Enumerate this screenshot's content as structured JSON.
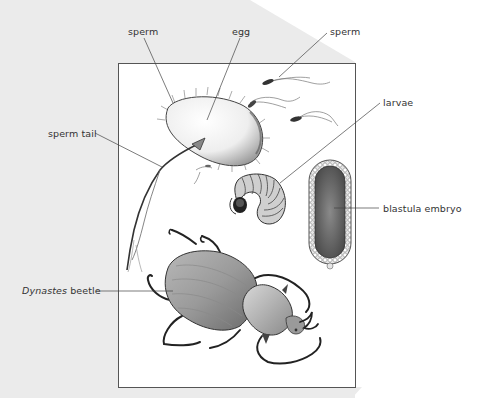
{
  "figure": {
    "type": "labeled biology illustration",
    "colors": {
      "background_panel": "#ebebeb",
      "page": "#ffffff",
      "frame_border": "#555555",
      "leader_line": "#444444",
      "label_text": "#333333"
    }
  },
  "labels": {
    "sperm_left": "sperm",
    "egg": "egg",
    "sperm_right": "sperm",
    "sperm_tail": "sperm tail",
    "larvae": "larvae",
    "blastula_embryo": "blastula embryo",
    "beetle_genus": "Dynastes",
    "beetle_word": "beetle"
  },
  "illustrations": [
    {
      "name": "egg",
      "description": "elongated oval egg with fine surface hairs"
    },
    {
      "name": "sperm",
      "description": "several sperm cells with long wavy tails"
    },
    {
      "name": "larva",
      "description": "curled C-shaped segmented grub"
    },
    {
      "name": "blastula-embryo",
      "description": "elongated oval with bead-like cell border"
    },
    {
      "name": "dynastes-beetle",
      "description": "adult rhinoceros beetle, top view"
    }
  ]
}
